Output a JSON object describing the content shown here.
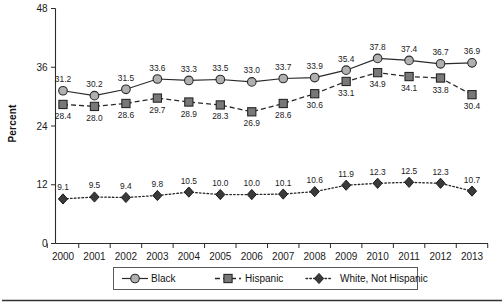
{
  "chart_data": {
    "type": "line",
    "title": "",
    "xlabel": "",
    "ylabel": "Percent",
    "categories": [
      "2000",
      "2001",
      "2002",
      "2003",
      "2004",
      "2005",
      "2006",
      "2007",
      "2008",
      "2009",
      "2010",
      "2011",
      "2012",
      "2013"
    ],
    "ylim": [
      0,
      48
    ],
    "yticks": [
      0,
      12,
      24,
      36,
      48
    ],
    "ytick_labels": [
      "0",
      "12",
      "24",
      "36",
      "48"
    ],
    "grid": false,
    "legend_position": "bottom-center",
    "series": [
      {
        "name": "Black",
        "marker": "circle",
        "linestyle": "solid",
        "label_position": "above",
        "values": [
          31.2,
          30.2,
          31.5,
          33.6,
          33.3,
          33.5,
          33.0,
          33.7,
          33.9,
          35.4,
          37.8,
          37.4,
          36.7,
          36.9
        ]
      },
      {
        "name": "Hispanic",
        "marker": "square",
        "linestyle": "dashed",
        "label_position": "below",
        "values": [
          28.4,
          28.0,
          28.6,
          29.7,
          28.9,
          28.3,
          26.9,
          28.6,
          30.6,
          33.1,
          34.9,
          34.1,
          33.8,
          30.4
        ]
      },
      {
        "name": "White, Not Hispanic",
        "marker": "diamond",
        "linestyle": "dotted",
        "label_position": "above",
        "values": [
          9.1,
          9.5,
          9.4,
          9.8,
          10.5,
          10.0,
          10.0,
          10.1,
          10.6,
          11.9,
          12.3,
          12.5,
          12.3,
          10.7
        ]
      }
    ],
    "colors": {
      "line": "#2a2a2a",
      "marker_black": "#b0b0b0",
      "marker_hispanic": "#787878",
      "marker_white_nonhispanic": "#3a3a3a",
      "text": "#1a1a1a",
      "background": "#ffffff"
    }
  }
}
